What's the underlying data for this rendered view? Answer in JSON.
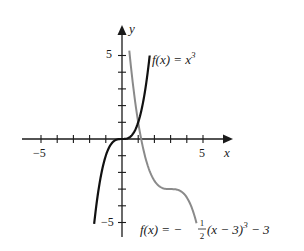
{
  "chart_data": {
    "type": "line",
    "title": "",
    "xlabel": "x",
    "ylabel": "y",
    "xlim": [
      -5.5,
      6
    ],
    "ylim": [
      -5.3,
      6
    ],
    "grid": false,
    "x_tick_labels": [
      "−5",
      "5"
    ],
    "y_tick_labels": [
      "5",
      "−5"
    ],
    "ticks": {
      "x": [
        -5,
        -4,
        -3,
        -2,
        -1,
        1,
        2,
        3,
        4,
        5
      ],
      "y": [
        -5,
        -4,
        -3,
        -2,
        -1,
        1,
        2,
        3,
        4,
        5
      ]
    },
    "series": [
      {
        "name": "f(x) = x³",
        "color": "#111111",
        "expression": "x^3",
        "x_range": [
          -1.72,
          1.71
        ],
        "x": [
          -1.72,
          -1.5,
          -1,
          -0.5,
          0,
          0.5,
          1,
          1.5,
          1.71
        ],
        "y": [
          -5.09,
          -3.375,
          -1,
          -0.125,
          0,
          0.125,
          1,
          3.375,
          5.0
        ]
      },
      {
        "name": "f(x) = −½(x − 3)³ − 3",
        "color": "#8a8a8a",
        "expression": "-0.5*(x-3)^3 - 3",
        "x_range": [
          0.45,
          4.6
        ],
        "x": [
          0.45,
          1,
          1.5,
          2,
          2.5,
          3,
          3.5,
          4,
          4.6
        ],
        "y": [
          5.29,
          1,
          -1.31,
          -2.5,
          -2.94,
          -3,
          -3.06,
          -3.5,
          -5.05
        ]
      }
    ],
    "annotations": [
      {
        "text_fn": "f(x) = x",
        "text_exp": "3",
        "near": "top of black curve"
      },
      {
        "text_prefix": "f(x) = −",
        "frac_num": "1",
        "frac_den": "2",
        "text_suffix": "(x − 3)",
        "text_exp": "3",
        "text_tail": " − 3",
        "near": "bottom of grey curve"
      }
    ]
  },
  "labels": {
    "x_axis": "x",
    "y_axis": "y",
    "x_neg5": "−5",
    "x_pos5": "5",
    "y_pos5": "5",
    "y_neg5": "−5",
    "cube_fx": "f(x) = x",
    "cube_exp": "3",
    "shift_fx": "f(x) = −",
    "shift_num": "1",
    "shift_den": "2",
    "shift_body": "(x − 3)",
    "shift_exp": "3",
    "shift_tail": " − 3"
  }
}
